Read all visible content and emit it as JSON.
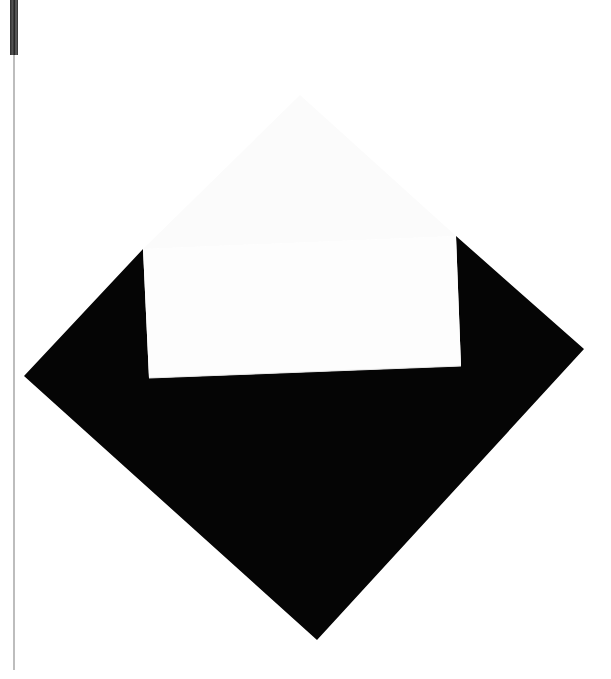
{
  "image": {
    "width": 611,
    "height": 679,
    "background_color": "#ffffff",
    "description": "Photograph of a black diamond (rotated square) shape partially covered by a white rectangular card, with a thin gray vertical line and dark bar at the left edge"
  },
  "diamond": {
    "color": "#050505",
    "vertices": {
      "left": [
        24,
        376
      ],
      "right": [
        584,
        349
      ],
      "bottom": [
        317,
        640
      ]
    },
    "upper_left_edge_to": [
      143,
      249
    ],
    "upper_right_edge_from": [
      456,
      236
    ]
  },
  "white_card": {
    "color": "#fdfdfd",
    "corners": {
      "top_left": [
        143,
        249
      ],
      "top_right": [
        456,
        236
      ],
      "bottom_right": [
        461,
        366
      ],
      "bottom_left": [
        149,
        378
      ]
    },
    "upper_ghost_shape_color": "#fafafa"
  },
  "left_edge": {
    "line_color": "#bdbdbd",
    "bar_color": "#333333"
  }
}
